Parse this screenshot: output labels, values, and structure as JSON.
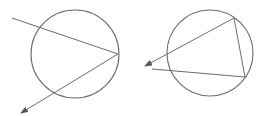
{
  "diagram": {
    "stroke_color": "#6b6b6b",
    "background": "#ffffff",
    "figures": [
      {
        "name": "left-figure",
        "circle": {
          "cx": 75,
          "cy": 54,
          "r": 44
        },
        "lines": [
          {
            "name": "secant-line",
            "x1": 12,
            "y1": 18,
            "x2": 118,
            "y2": 54,
            "arrow": false
          },
          {
            "name": "arrow-line",
            "x1": 118,
            "y1": 54,
            "x2": 21,
            "y2": 113,
            "arrow": true
          }
        ]
      },
      {
        "name": "right-figure",
        "circle": {
          "cx": 210,
          "cy": 53,
          "r": 43
        },
        "lines": [
          {
            "name": "arrow-line",
            "x1": 234,
            "y1": 18,
            "x2": 145,
            "y2": 66,
            "arrow": true
          },
          {
            "name": "chord-line",
            "x1": 234,
            "y1": 18,
            "x2": 245,
            "y2": 77,
            "arrow": false
          },
          {
            "name": "secant-line",
            "x1": 245,
            "y1": 77,
            "x2": 152,
            "y2": 69,
            "arrow": false
          }
        ]
      }
    ]
  }
}
